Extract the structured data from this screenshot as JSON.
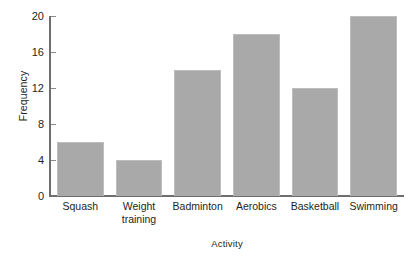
{
  "chart_data": {
    "type": "bar",
    "title": "",
    "xlabel": "Activity",
    "ylabel": "Frequency",
    "categories": [
      "Squash",
      "Weight training",
      "Badminton",
      "Aerobics",
      "Basketball",
      "Swimming"
    ],
    "values": [
      6,
      4,
      14,
      18,
      12,
      20
    ],
    "ylim": [
      0,
      20
    ],
    "yticks": [
      0,
      4,
      8,
      12,
      16,
      20
    ],
    "ytick_labels": [
      "0",
      "4",
      "8",
      "12",
      "16",
      "20"
    ],
    "grid": false,
    "legend": null,
    "bar_color": "#a9a9a9",
    "bar_border_color": "#bdbdbd",
    "axis_color": "#6e6e6e",
    "text_color": "#231f20",
    "background": "#ffffff"
  },
  "axes": {
    "y_title": "Frequency",
    "x_title": "Activity"
  },
  "bars": [
    {
      "label": "Squash",
      "label_line1": "Squash",
      "label_line2": "",
      "value": 6
    },
    {
      "label": "Weight training",
      "label_line1": "Weight",
      "label_line2": "training",
      "value": 4
    },
    {
      "label": "Badminton",
      "label_line1": "Badminton",
      "label_line2": "",
      "value": 14
    },
    {
      "label": "Aerobics",
      "label_line1": "Aerobics",
      "label_line2": "",
      "value": 18
    },
    {
      "label": "Basketball",
      "label_line1": "Basketball",
      "label_line2": "",
      "value": 12
    },
    {
      "label": "Swimming",
      "label_line1": "Swimming",
      "label_line2": "",
      "value": 20
    }
  ],
  "yticks": [
    {
      "label": "20",
      "value": 20
    },
    {
      "label": "16",
      "value": 16
    },
    {
      "label": "12",
      "value": 12
    },
    {
      "label": "8",
      "value": 8
    },
    {
      "label": "4",
      "value": 4
    },
    {
      "label": "0",
      "value": 0
    }
  ]
}
